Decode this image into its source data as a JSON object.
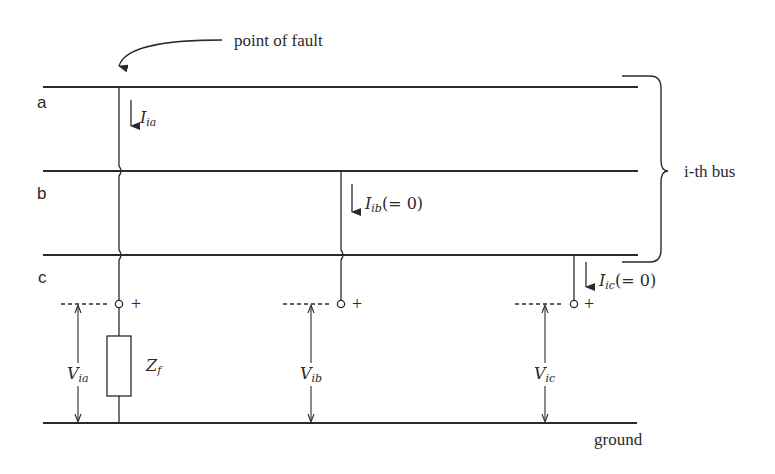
{
  "diagram": {
    "title_annotation": "point of fault",
    "bus_group_label": "i-th bus",
    "ground_label": "ground",
    "phases": [
      {
        "name": "a",
        "current_symbol": "I",
        "current_sub": "ia",
        "current_note": "",
        "voltage_symbol": "V",
        "voltage_sub": "ia"
      },
      {
        "name": "b",
        "current_symbol": "I",
        "current_sub": "ib",
        "current_note": "(= 0)",
        "voltage_symbol": "V",
        "voltage_sub": "ib"
      },
      {
        "name": "c",
        "current_symbol": "I",
        "current_sub": "ic",
        "current_note": "(= 0)",
        "voltage_symbol": "V",
        "voltage_sub": "ic"
      }
    ],
    "impedance": {
      "symbol": "Z",
      "sub": "f"
    },
    "terminal_polarity": "+",
    "colors": {
      "line": "#2a2a2a",
      "background": "#ffffff"
    }
  }
}
